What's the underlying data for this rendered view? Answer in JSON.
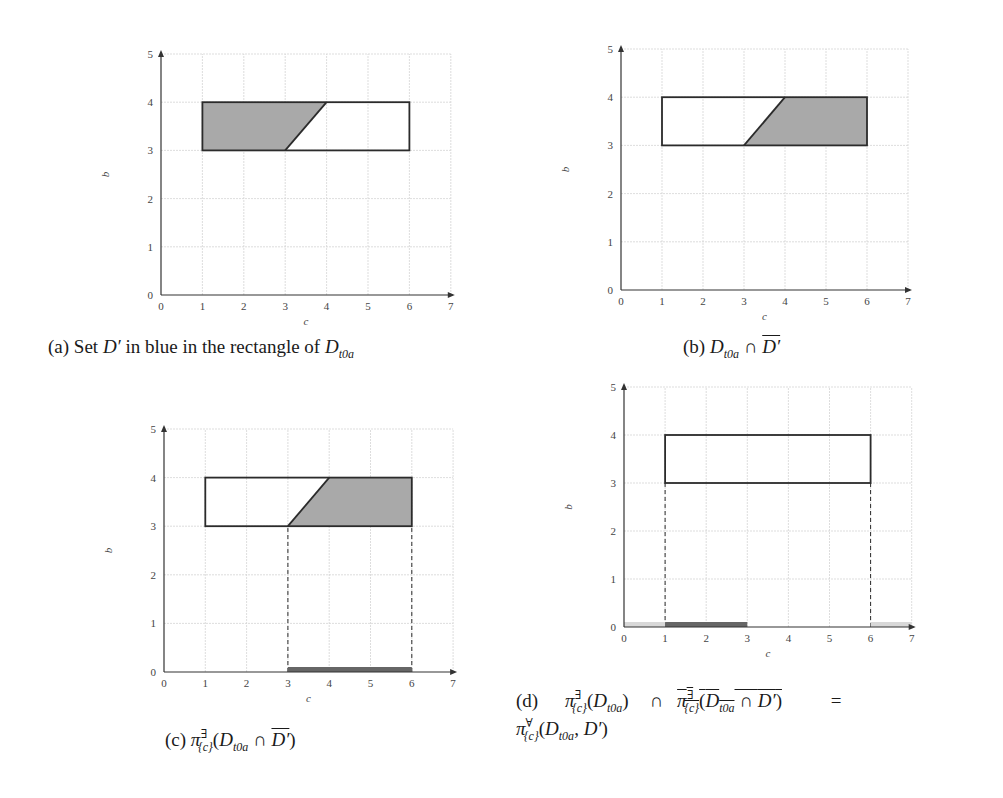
{
  "chart_data": [
    {
      "id": "a",
      "type": "area",
      "title": "",
      "xlabel": "c",
      "ylabel": "b",
      "xlim": [
        0,
        7
      ],
      "ylim": [
        0,
        5
      ],
      "xticks": [
        "0",
        "1",
        "2",
        "3",
        "4",
        "5",
        "6",
        "7"
      ],
      "yticks": [
        "0",
        "1",
        "2",
        "3",
        "4",
        "5"
      ],
      "grid": true,
      "rectangle": {
        "x": [
          1,
          6
        ],
        "y": [
          3,
          4
        ]
      },
      "shaded_region": [
        [
          1,
          3
        ],
        [
          3,
          3
        ],
        [
          4,
          4
        ],
        [
          1,
          4
        ]
      ],
      "diagonal_edge": [
        [
          3,
          3
        ],
        [
          4,
          4
        ]
      ],
      "projection_bars": [],
      "dashed_lines": []
    },
    {
      "id": "b",
      "type": "area",
      "title": "",
      "xlabel": "c",
      "ylabel": "b",
      "xlim": [
        0,
        7
      ],
      "ylim": [
        0,
        5
      ],
      "xticks": [
        "0",
        "1",
        "2",
        "3",
        "4",
        "5",
        "6",
        "7"
      ],
      "yticks": [
        "0",
        "1",
        "2",
        "3",
        "4",
        "5"
      ],
      "grid": true,
      "rectangle": {
        "x": [
          1,
          6
        ],
        "y": [
          3,
          4
        ]
      },
      "shaded_region": [
        [
          3,
          3
        ],
        [
          6,
          3
        ],
        [
          6,
          4
        ],
        [
          4,
          4
        ]
      ],
      "diagonal_edge": [
        [
          3,
          3
        ],
        [
          4,
          4
        ]
      ],
      "projection_bars": [],
      "dashed_lines": []
    },
    {
      "id": "c",
      "type": "area",
      "title": "",
      "xlabel": "c",
      "ylabel": "b",
      "xlim": [
        0,
        7
      ],
      "ylim": [
        0,
        5
      ],
      "xticks": [
        "0",
        "1",
        "2",
        "3",
        "4",
        "5",
        "6",
        "7"
      ],
      "yticks": [
        "0",
        "1",
        "2",
        "3",
        "4",
        "5"
      ],
      "grid": true,
      "rectangle": {
        "x": [
          1,
          6
        ],
        "y": [
          3,
          4
        ]
      },
      "shaded_region": [
        [
          3,
          3
        ],
        [
          6,
          3
        ],
        [
          6,
          4
        ],
        [
          4,
          4
        ]
      ],
      "diagonal_edge": [
        [
          3,
          3
        ],
        [
          4,
          4
        ]
      ],
      "projection_bars": [
        {
          "x": [
            3,
            6
          ],
          "style": "dark"
        }
      ],
      "dashed_lines": [
        {
          "x": 3,
          "y": [
            0,
            3
          ]
        },
        {
          "x": 6,
          "y": [
            0,
            3
          ]
        }
      ]
    },
    {
      "id": "d",
      "type": "area",
      "title": "",
      "xlabel": "c",
      "ylabel": "b",
      "xlim": [
        0,
        7
      ],
      "ylim": [
        0,
        5
      ],
      "xticks": [
        "0",
        "1",
        "2",
        "3",
        "4",
        "5",
        "6",
        "7"
      ],
      "yticks": [
        "0",
        "1",
        "2",
        "3",
        "4",
        "5"
      ],
      "grid": true,
      "rectangle": {
        "x": [
          1,
          6
        ],
        "y": [
          3,
          4
        ]
      },
      "shaded_region": [],
      "diagonal_edge": [],
      "projection_bars": [
        {
          "x": [
            0,
            1
          ],
          "style": "light"
        },
        {
          "x": [
            1,
            3
          ],
          "style": "dark"
        },
        {
          "x": [
            6,
            7
          ],
          "style": "light"
        }
      ],
      "dashed_lines": [
        {
          "x": 1,
          "y": [
            0,
            3
          ]
        },
        {
          "x": 6,
          "y": [
            0,
            3
          ]
        }
      ]
    }
  ],
  "colors": {
    "shade": "#a9a9a9",
    "outline": "#2b2b2b",
    "grid": "#d4d4d4",
    "axis": "#333333",
    "bar_dark": "#666666",
    "bar_light": "#d8d8d8"
  },
  "captions": {
    "a": {
      "prefix": "(a) Set ",
      "sym": "D′",
      "mid": " in blue in the rectangle of ",
      "base": "D",
      "sub": "t0a"
    },
    "b": {
      "prefix": "(b) ",
      "base": "D",
      "sub": "t0a",
      "op": " ∩ ",
      "bar": "D′"
    },
    "c": {
      "prefix": "(c) ",
      "pi": "π",
      "sup": "∃",
      "psub": "{c}",
      "open": "(",
      "base": "D",
      "sub": "t0a",
      "op": " ∩ ",
      "bar": "D′",
      "close": ")"
    },
    "d": {
      "prefix": "(d)",
      "pi": "π",
      "sup_exists": "∃",
      "sup_forall": "∀",
      "psub": "{c}",
      "term1_open": "(",
      "base": "D",
      "sub": "t0a",
      "term1_close": ")",
      "op": "∩",
      "inner_op": " ∩ ",
      "bar": "D′",
      "eq": "=",
      "line2_args": ", "
    }
  }
}
